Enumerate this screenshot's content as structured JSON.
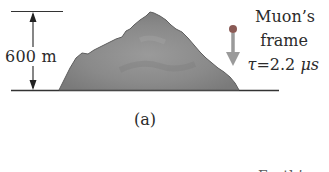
{
  "figure": {
    "height_label": "600 m",
    "mountain": {
      "color": "#8c8c8c",
      "shade": "#6f6f6f"
    },
    "muon": {
      "title_line1": "Muon’s",
      "title_line2": "frame",
      "tau_symbol": "τ",
      "equals": "=",
      "tau_value": "2.2",
      "tau_unit": "μs",
      "particle_color": "#8a5a55",
      "arrow_color": "#9a9a9a"
    },
    "caption": "(a)",
    "partial_text_bottom": "Earth’s"
  }
}
